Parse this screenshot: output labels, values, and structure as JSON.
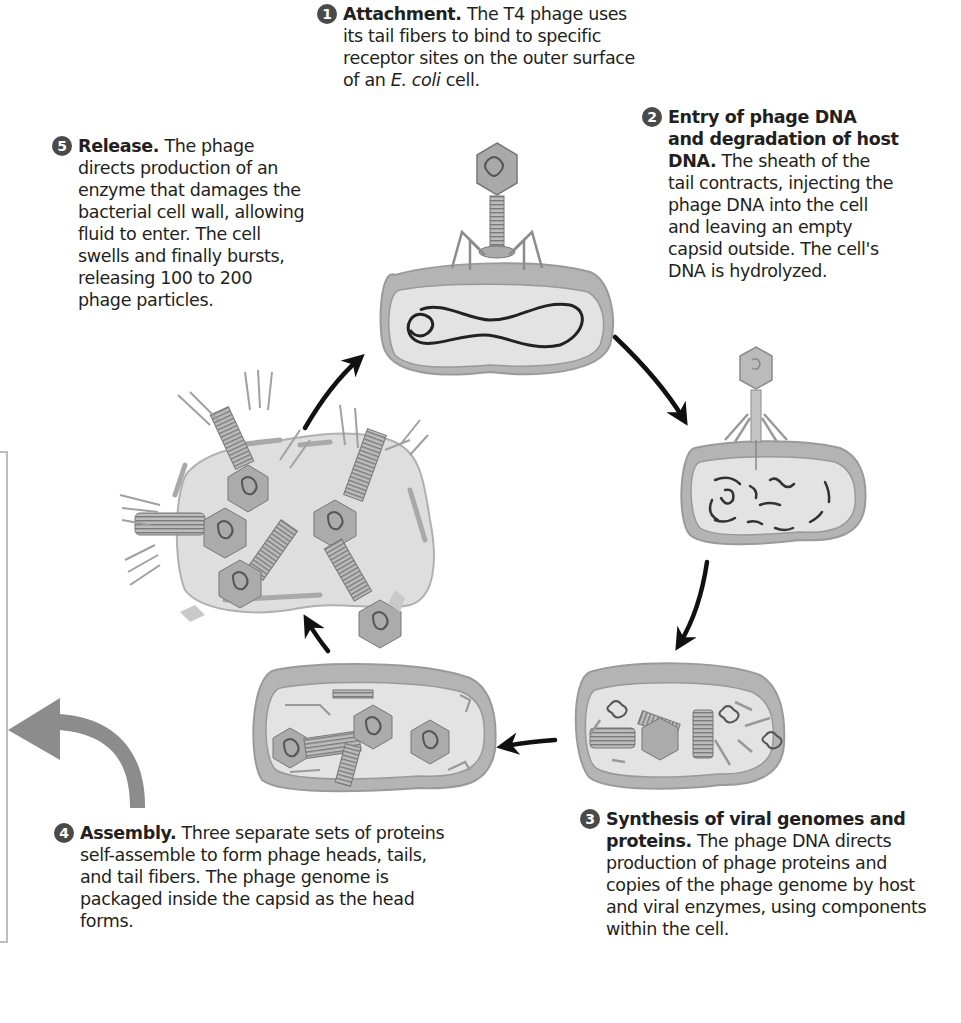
{
  "steps": [
    {
      "number": "1",
      "title": "Attachment.",
      "text_parts": [
        "The T4 phage uses its tail fibers to bind to specific receptor sites on the outer surface of an ",
        "E. coli",
        " cell."
      ],
      "lines": [
        "The T4 phage uses",
        "its tail fibers to bind to specific",
        "receptor sites on the outer surface",
        "of an "
      ]
    },
    {
      "number": "2",
      "title_lines": [
        "Entry of phage DNA",
        "and degradation of host",
        "DNA."
      ],
      "text_lines": [
        "The sheath of the",
        "tail contracts, injecting the",
        "phage DNA into the cell",
        "and leaving an empty",
        "capsid outside. The cell's",
        "DNA is hydrolyzed."
      ]
    },
    {
      "number": "3",
      "title_lines": [
        "Synthesis of viral genomes and",
        "proteins."
      ],
      "text_lines": [
        "The phage DNA directs",
        "production of phage proteins and",
        "copies of the phage genome by host",
        "and viral enzymes, using components",
        "within the cell."
      ]
    },
    {
      "number": "4",
      "title": "Assembly.",
      "text_lines": [
        "Three separate sets of proteins",
        "self-assemble to form phage heads, tails,",
        "and tail fibers. The phage genome is",
        "packaged inside the capsid as the head",
        "forms."
      ]
    },
    {
      "number": "5",
      "title": "Release.",
      "text_lines": [
        "The phage",
        "directs production of an",
        "enzyme that damages the",
        "bacterial cell wall, allowing",
        "fluid to enter. The cell",
        "swells and finally bursts,",
        "releasing 100 to 200",
        "phage particles."
      ]
    }
  ],
  "italic_term": "E. coli",
  "tail_word": "cell.",
  "colors": {
    "text": "#231f20",
    "badge": "#4a4a4a",
    "cell_wall": "#a9a9a9",
    "cytoplasm": "#dedede",
    "arrow": "#111111",
    "big_arrow": "#8c8c8c",
    "bracket": "#bdbdbd"
  }
}
